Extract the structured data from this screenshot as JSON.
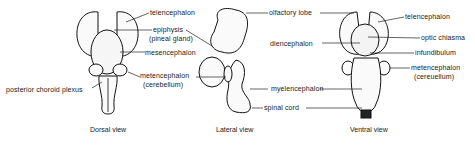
{
  "figure": {
    "views": [
      {
        "caption": "Dorsal view",
        "labels": {
          "telencephalon": "telencephalon",
          "epiphysis": "epiphysis",
          "pineal_gland": "(pineal gland)",
          "mesencephalon": "mesencephalon",
          "metencephalon": "metencephalon",
          "cerebellum": "(cerebellum)",
          "posterior_choroid_plexus": "posterior choroid plexus"
        }
      },
      {
        "caption": "Lateral view",
        "labels": {
          "olfactory_lobe": "olfactory  lobe",
          "diencephalon": "diencephalon",
          "myelencephalon": "myelencephalon",
          "spinal_cord": "spinal cord"
        }
      },
      {
        "caption": "Ventral view",
        "labels": {
          "telencephalon": "telencephalon",
          "optic_chiasma": "optic chiasma",
          "infundibulum": "infundibulum",
          "metencephalon": "metencephalon",
          "cerebellum": "(cereuellum)"
        }
      }
    ]
  }
}
